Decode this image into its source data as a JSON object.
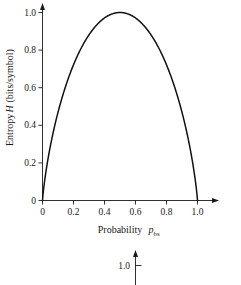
{
  "figure": {
    "caption_present": false,
    "background_color": "#ffffff",
    "ink_color": "#1a1a1a",
    "curve_color": "#111111"
  },
  "main_plot": {
    "xlabel_text": "Probability",
    "xlabel_symbol": "p",
    "xlabel_subscript": "bs",
    "ylabel_text_left": "Entropy",
    "ylabel_symbol": "H",
    "ylabel_text_right": "(bits/symbol)",
    "x_ticks": [
      "0",
      "0.2",
      "0.4",
      "0.6",
      "0.8",
      "1.0"
    ],
    "y_ticks": [
      "0",
      "0.2",
      "0.4",
      "0.6",
      "0.8",
      "1.0"
    ],
    "x_arrowhead": "right-arrow-icon",
    "y_arrowhead": "up-arrow-icon"
  },
  "secondary_plot": {
    "y_tick_label": "1.0",
    "y_arrowhead": "up-arrow-icon"
  },
  "chart_data": {
    "type": "line",
    "title": "",
    "subtitle": "",
    "xlabel": "Probability p_bs",
    "ylabel": "Entropy H (bits/symbol)",
    "xlim": [
      0,
      1.08
    ],
    "ylim": [
      0,
      1.05
    ],
    "xticks": [
      0,
      0.2,
      0.4,
      0.6,
      0.8,
      1.0
    ],
    "xticklabels": [
      "0",
      "0.2",
      "0.4",
      "0.6",
      "0.8",
      "1.0"
    ],
    "yticks": [
      0,
      0.2,
      0.4,
      0.6,
      0.8,
      1.0
    ],
    "yticklabels": [
      "0",
      "0.2",
      "0.4",
      "0.6",
      "0.8",
      "1.0"
    ],
    "grid": false,
    "legend": false,
    "legend_position": "none",
    "series": [
      {
        "name": "Binary entropy H(p) = -p log2 p - (1-p) log2 (1-p)",
        "x": [
          0.0,
          0.01,
          0.02,
          0.03,
          0.05,
          0.07,
          0.1,
          0.15,
          0.2,
          0.25,
          0.3,
          0.35,
          0.4,
          0.45,
          0.5,
          0.55,
          0.6,
          0.65,
          0.7,
          0.75,
          0.8,
          0.85,
          0.9,
          0.93,
          0.95,
          0.97,
          0.98,
          0.99,
          1.0
        ],
        "y": [
          0.0,
          0.081,
          0.141,
          0.194,
          0.286,
          0.366,
          0.469,
          0.61,
          0.722,
          0.811,
          0.881,
          0.934,
          0.971,
          0.993,
          1.0,
          0.993,
          0.971,
          0.934,
          0.881,
          0.811,
          0.722,
          0.61,
          0.469,
          0.366,
          0.286,
          0.194,
          0.141,
          0.081,
          0.0
        ]
      }
    ],
    "annotations": [
      {
        "text": "1.0",
        "note": "y-axis tick of a second, partially cropped figure below the main plot"
      }
    ]
  }
}
